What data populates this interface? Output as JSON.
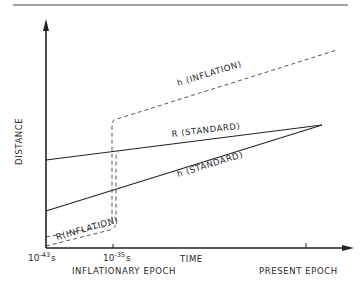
{
  "diagram": {
    "title": "",
    "y_axis": {
      "label": "DISTANCE"
    },
    "x_axis": {
      "label": "TIME",
      "ticks": [
        {
          "base": "10",
          "exp": "-43",
          "unit": "s"
        },
        {
          "base": "10",
          "exp": "-35",
          "unit": "s"
        }
      ],
      "epochs": {
        "inflationary": "INFLATIONARY EPOCH",
        "present": "PRESENT EPOCH"
      }
    },
    "curves": {
      "h_inflation": "h (INFLATION)",
      "r_standard": "R (STANDARD)",
      "h_standard": "h (STANDARD)",
      "r_inflation": "R(INFLATION)"
    },
    "colors": {
      "ink": "#2a2a2a",
      "background": "#ffffff"
    }
  }
}
